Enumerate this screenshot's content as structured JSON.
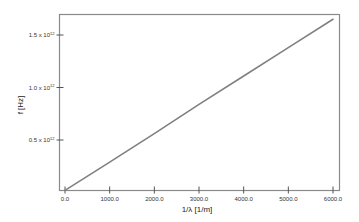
{
  "chart_data": {
    "type": "line",
    "title": "",
    "xlabel": "1/λ [1/m]",
    "ylabel": "f [Hz]",
    "xlim": [
      -50,
      6130
    ],
    "ylim": [
      20000000000.0,
      1700000000000.0
    ],
    "grid": false,
    "legend": null,
    "x_ticks": [
      {
        "value": 0,
        "label": "0.0"
      },
      {
        "value": 1000,
        "label": "1000.0"
      },
      {
        "value": 2000,
        "label": "2000.0"
      },
      {
        "value": 3000,
        "label": "3000.0"
      },
      {
        "value": 4000,
        "label": "4000.0"
      },
      {
        "value": 5000,
        "label": "5000.0"
      },
      {
        "value": 6000,
        "label": "6000.0"
      }
    ],
    "y_ticks": [
      {
        "value": 500000000000.0,
        "mantissa": "0.5",
        "exponent": "12"
      },
      {
        "value": 1000000000000.0,
        "mantissa": "1.0",
        "exponent": "12"
      },
      {
        "value": 1500000000000.0,
        "mantissa": "1.5",
        "exponent": "12"
      }
    ],
    "series": [
      {
        "name": "f vs 1/λ",
        "color": "#808080",
        "x": [
          0,
          1000,
          2000,
          3000,
          4000,
          5000,
          6000
        ],
        "y": [
          20000000000.0,
          290000000000.0,
          560000000000.0,
          840000000000.0,
          1110000000000.0,
          1380000000000.0,
          1650000000000.0
        ]
      }
    ]
  },
  "colors": {
    "frame": "#8a8a8a",
    "line": "#808080",
    "text": "#333333"
  }
}
